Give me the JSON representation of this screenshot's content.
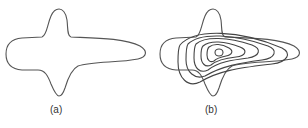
{
  "figure": {
    "panels": [
      {
        "id": "a",
        "label": "(a)",
        "description": "Outline of a shape with a rounded left lobe, vertical spikes top and bottom, and an elongated right tongue"
      },
      {
        "id": "b",
        "label": "(b)",
        "description": "Same outline overlaid with nested closed contour curves converging to a small inner loop"
      }
    ],
    "colors": {
      "stroke": "#555555",
      "background": "#ffffff"
    }
  }
}
